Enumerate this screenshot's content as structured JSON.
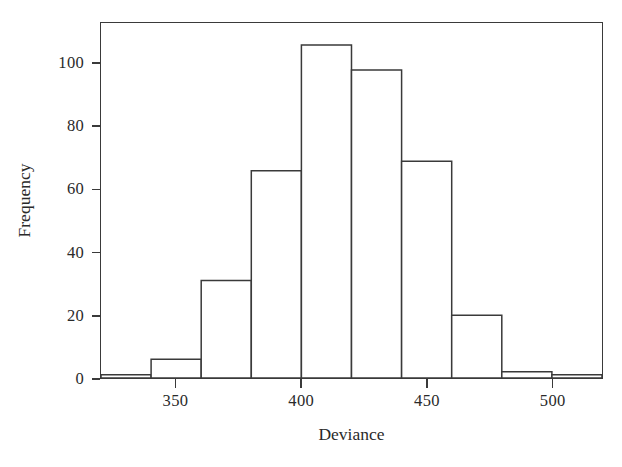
{
  "chart_data": {
    "type": "bar",
    "subtype": "histogram",
    "title": "",
    "xlabel": "Deviance",
    "ylabel": "Frequency",
    "xlim": [
      320,
      520
    ],
    "ylim": [
      0,
      113
    ],
    "bin_width": 20,
    "bin_edges": [
      320,
      340,
      360,
      380,
      400,
      420,
      440,
      460,
      480,
      500,
      520
    ],
    "categories": [
      "320-340",
      "340-360",
      "360-380",
      "380-400",
      "400-420",
      "420-440",
      "440-460",
      "460-480",
      "480-500",
      "500-520"
    ],
    "bin_centers": [
      330,
      350,
      370,
      390,
      410,
      430,
      450,
      470,
      490,
      510
    ],
    "values": [
      1,
      6,
      31,
      66,
      106,
      98,
      69,
      20,
      2,
      1
    ],
    "x_ticks": [
      350,
      400,
      450,
      500
    ],
    "x_tick_labels": [
      "350",
      "400",
      "450",
      "500"
    ],
    "y_ticks": [
      0,
      20,
      40,
      60,
      80,
      100
    ],
    "y_tick_labels": [
      "0",
      "20",
      "40",
      "60",
      "80",
      "100"
    ],
    "grid": false,
    "legend": false,
    "bar_fill_color": "#ffffff",
    "bar_edge_color": "#3a3a3a",
    "axis_color": "#3a3a3a",
    "background_color": "#ffffff"
  },
  "axes": {
    "x_title": "Deviance",
    "y_title": "Frequency"
  }
}
